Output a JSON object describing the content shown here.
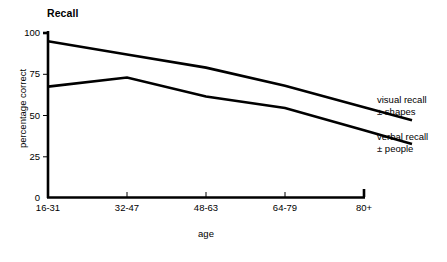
{
  "chart_data": {
    "type": "line",
    "title": "Recall",
    "xlabel": "age",
    "ylabel": "percentage correct",
    "categories": [
      "16-31",
      "32-47",
      "48-63",
      "64-79",
      "80+"
    ],
    "yticks": [
      "0",
      "25",
      "50",
      "75",
      "100"
    ],
    "ylim": [
      0,
      100
    ],
    "grid": false,
    "legend_position": "right-inline",
    "series": [
      {
        "name": "visual recall ± shapes",
        "name_line1": "visual recall",
        "name_line2": "± shapes",
        "values": [
          95,
          87,
          79,
          68,
          55
        ],
        "color": "#000000"
      },
      {
        "name": "verbal recall ± people",
        "name_line1": "verbal recall",
        "name_line2": "± people",
        "values": [
          67.5,
          73,
          61.5,
          54.5,
          41
        ],
        "color": "#000000"
      }
    ]
  }
}
